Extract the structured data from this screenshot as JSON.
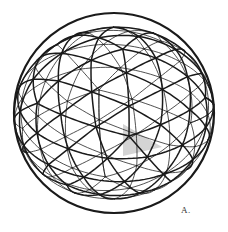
{
  "figure": {
    "label": "A.",
    "label_pos": {
      "x": 181,
      "y": 205
    },
    "background": "#ffffff",
    "stroke_color": "#1a1a1a",
    "shade_color": "#d4d4d4"
  },
  "sphere": {
    "cx": 114,
    "cy": 113,
    "r": 100,
    "base": "icosahedron",
    "frequency": 3,
    "rotation_deg": {
      "x": -14,
      "y": 8,
      "z": 4
    },
    "front_stroke_width": 1.5,
    "back_stroke_width": 0.9,
    "outline_stroke_width": 2.2
  },
  "shaded_triangle": {
    "points": [
      [
        123,
        124
      ],
      [
        123,
        156
      ],
      [
        162,
        147
      ]
    ]
  },
  "visible_vertices": [
    [
      118,
      24
    ],
    [
      63,
      50
    ],
    [
      121,
      51
    ],
    [
      170,
      55
    ],
    [
      30,
      100
    ],
    [
      83,
      100
    ],
    [
      156,
      102
    ],
    [
      198,
      102
    ],
    [
      122,
      124
    ],
    [
      61,
      151
    ],
    [
      121,
      158
    ],
    [
      172,
      150
    ],
    [
      88,
      190
    ],
    [
      156,
      188
    ],
    [
      116,
      210
    ]
  ]
}
